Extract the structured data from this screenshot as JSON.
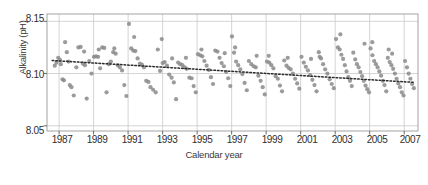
{
  "chart_data": {
    "type": "scatter",
    "title": "",
    "xlabel": "Calendar year",
    "ylabel": "Alkalinity (pH)",
    "xlim": [
      1986.3,
      2007.8
    ],
    "ylim": [
      8.045,
      8.157
    ],
    "xticks": [
      "1987",
      "1989",
      "1991",
      "1993",
      "1995",
      "1997",
      "1999",
      "2001",
      "2003",
      "2005",
      "2007"
    ],
    "xtick_values": [
      1987,
      1989,
      1991,
      1993,
      1995,
      1997,
      1999,
      2001,
      2003,
      2005,
      2007
    ],
    "yticks": [
      "8.05",
      "8.10",
      "8.15"
    ],
    "ytick_values": [
      8.05,
      8.1,
      8.15
    ],
    "grid": true,
    "grid_color": "#c9c9c9",
    "legend": "none",
    "marker_color": "#8a8a8a",
    "marker_shape": "circle",
    "marker_size": 2.1,
    "trend": {
      "name": "fitted trend",
      "style": "dotted",
      "color": "#2b2b2b",
      "x_start": 1986.6,
      "x_end": 2007.6,
      "y_start": 8.1125,
      "y_end": 8.0915
    },
    "series": [
      {
        "name": "Alkalinity (pH)",
        "points": [
          [
            1986.75,
            8.1075
          ],
          [
            1986.85,
            8.1105
          ],
          [
            1986.95,
            8.115
          ],
          [
            1987.05,
            8.113
          ],
          [
            1987.1,
            8.109
          ],
          [
            1987.2,
            8.0945
          ],
          [
            1987.28,
            8.0935
          ],
          [
            1987.35,
            8.13
          ],
          [
            1987.45,
            8.1205
          ],
          [
            1987.55,
            8.1115
          ],
          [
            1987.62,
            8.089
          ],
          [
            1987.72,
            8.087
          ],
          [
            1987.85,
            8.079
          ],
          [
            1988.0,
            8.106
          ],
          [
            1988.12,
            8.125
          ],
          [
            1988.25,
            8.1255
          ],
          [
            1988.38,
            8.1095
          ],
          [
            1988.5,
            8.108
          ],
          [
            1988.6,
            8.076
          ],
          [
            1988.75,
            8.112
          ],
          [
            1988.88,
            8.1
          ],
          [
            1989.02,
            8.116
          ],
          [
            1989.14,
            8.1165
          ],
          [
            1989.26,
            8.116
          ],
          [
            1989.38,
            8.105
          ],
          [
            1989.5,
            8.125
          ],
          [
            1989.62,
            8.1245
          ],
          [
            1989.75,
            8.082
          ],
          [
            1989.88,
            8.109
          ],
          [
            1990.0,
            8.1115
          ],
          [
            1990.14,
            8.1205
          ],
          [
            1990.28,
            8.119
          ],
          [
            1990.4,
            8.108
          ],
          [
            1990.52,
            8.106
          ],
          [
            1990.65,
            8.103
          ],
          [
            1990.78,
            8.089
          ],
          [
            1990.9,
            8.0785
          ],
          [
            1991.05,
            8.1475
          ],
          [
            1991.18,
            8.124
          ],
          [
            1991.3,
            8.122
          ],
          [
            1991.42,
            8.1215
          ],
          [
            1991.55,
            8.1145
          ],
          [
            1991.68,
            8.1095
          ],
          [
            1991.8,
            8.1085
          ],
          [
            1991.92,
            8.106
          ],
          [
            1992.05,
            8.093
          ],
          [
            1992.18,
            8.092
          ],
          [
            1992.3,
            8.087
          ],
          [
            1992.45,
            8.0845
          ],
          [
            1992.6,
            8.082
          ],
          [
            1992.72,
            8.123
          ],
          [
            1992.85,
            8.1025
          ],
          [
            1993.0,
            8.11
          ],
          [
            1993.12,
            8.111
          ],
          [
            1993.25,
            8.1075
          ],
          [
            1993.38,
            8.099
          ],
          [
            1993.52,
            8.096
          ],
          [
            1993.65,
            8.0915
          ],
          [
            1993.78,
            8.0755
          ],
          [
            1993.9,
            8.1105
          ],
          [
            1994.02,
            8.109
          ],
          [
            1994.15,
            8.108
          ],
          [
            1994.28,
            8.106
          ],
          [
            1994.4,
            8.1045
          ],
          [
            1994.55,
            8.096
          ],
          [
            1994.68,
            8.0955
          ],
          [
            1994.8,
            8.088
          ],
          [
            1994.92,
            8.082
          ],
          [
            1995.05,
            8.1185
          ],
          [
            1995.18,
            8.1175
          ],
          [
            1995.3,
            8.1165
          ],
          [
            1995.42,
            8.112
          ],
          [
            1995.55,
            8.1075
          ],
          [
            1995.68,
            8.1035
          ],
          [
            1995.8,
            8.0965
          ],
          [
            1995.92,
            8.09
          ],
          [
            1996.05,
            8.122
          ],
          [
            1996.18,
            8.121
          ],
          [
            1996.3,
            8.115
          ],
          [
            1996.42,
            8.11
          ],
          [
            1996.55,
            8.107
          ],
          [
            1996.68,
            8.1015
          ],
          [
            1996.8,
            8.0955
          ],
          [
            1996.92,
            8.088
          ],
          [
            1997.02,
            8.1355
          ],
          [
            1997.14,
            8.12
          ],
          [
            1997.26,
            8.1115
          ],
          [
            1997.38,
            8.108
          ],
          [
            1997.5,
            8.104
          ],
          [
            1997.62,
            8.0995
          ],
          [
            1997.75,
            8.091
          ],
          [
            1997.88,
            8.084
          ],
          [
            1998.0,
            8.112
          ],
          [
            1998.14,
            8.109
          ],
          [
            1998.28,
            8.107
          ],
          [
            1998.4,
            8.106
          ],
          [
            1998.55,
            8.098
          ],
          [
            1998.68,
            8.093
          ],
          [
            1998.8,
            8.087
          ],
          [
            1998.92,
            8.08
          ],
          [
            1999.05,
            8.1115
          ],
          [
            1999.18,
            8.1105
          ],
          [
            1999.3,
            8.108
          ],
          [
            1999.42,
            8.105
          ],
          [
            1999.55,
            8.0975
          ],
          [
            1999.68,
            8.095
          ],
          [
            1999.8,
            8.0885
          ],
          [
            1999.92,
            8.083
          ],
          [
            2000.05,
            8.1125
          ],
          [
            2000.18,
            8.1075
          ],
          [
            2000.3,
            8.1055
          ],
          [
            2000.42,
            8.104
          ],
          [
            2000.55,
            8.1
          ],
          [
            2000.68,
            8.095
          ],
          [
            2000.8,
            8.0905
          ],
          [
            2000.92,
            8.0855
          ],
          [
            2001.05,
            8.116
          ],
          [
            2001.18,
            8.1105
          ],
          [
            2001.3,
            8.1065
          ],
          [
            2001.42,
            8.103
          ],
          [
            2001.55,
            8.0985
          ],
          [
            2001.68,
            8.094
          ],
          [
            2001.8,
            8.089
          ],
          [
            2001.92,
            8.083
          ],
          [
            2002.05,
            8.1205
          ],
          [
            2002.18,
            8.1145
          ],
          [
            2002.3,
            8.109
          ],
          [
            2002.42,
            8.104
          ],
          [
            2002.55,
            8.1
          ],
          [
            2002.68,
            8.0945
          ],
          [
            2002.8,
            8.09
          ],
          [
            2002.92,
            8.086
          ],
          [
            2003.05,
            8.133
          ],
          [
            2003.16,
            8.125
          ],
          [
            2003.26,
            8.123
          ],
          [
            2003.36,
            8.118
          ],
          [
            2003.46,
            8.114
          ],
          [
            2003.56,
            8.108
          ],
          [
            2003.66,
            8.102
          ],
          [
            2003.76,
            8.0965
          ],
          [
            2003.86,
            8.093
          ],
          [
            2003.96,
            8.088
          ],
          [
            2004.05,
            8.12
          ],
          [
            2004.16,
            8.1135
          ],
          [
            2004.26,
            8.109
          ],
          [
            2004.36,
            8.106
          ],
          [
            2004.46,
            8.1015
          ],
          [
            2004.56,
            8.0975
          ],
          [
            2004.66,
            8.093
          ],
          [
            2004.76,
            8.0885
          ],
          [
            2004.86,
            8.085
          ],
          [
            2004.96,
            8.082
          ],
          [
            2005.05,
            8.124
          ],
          [
            2005.16,
            8.1175
          ],
          [
            2005.26,
            8.112
          ],
          [
            2005.36,
            8.109
          ],
          [
            2005.46,
            8.106
          ],
          [
            2005.56,
            8.102
          ],
          [
            2005.66,
            8.098
          ],
          [
            2005.76,
            8.093
          ],
          [
            2005.86,
            8.089
          ],
          [
            2005.96,
            8.083
          ],
          [
            2006.05,
            8.115
          ],
          [
            2006.16,
            8.111
          ],
          [
            2006.26,
            8.108
          ],
          [
            2006.36,
            8.1045
          ],
          [
            2006.46,
            8.1
          ],
          [
            2006.56,
            8.095
          ],
          [
            2006.66,
            8.0905
          ],
          [
            2006.76,
            8.087
          ],
          [
            2006.86,
            8.082
          ],
          [
            2006.96,
            8.079
          ],
          [
            2007.05,
            8.112
          ],
          [
            2007.16,
            8.106
          ],
          [
            2007.26,
            8.1
          ],
          [
            2007.36,
            8.095
          ],
          [
            2007.46,
            8.09
          ],
          [
            2007.56,
            8.086
          ],
          [
            1991.35,
            8.135
          ],
          [
            1992.95,
            8.133
          ],
          [
            1998.45,
            8.117
          ],
          [
            2003.3,
            8.1375
          ],
          [
            2004.7,
            8.1285
          ],
          [
            2005.15,
            8.13
          ],
          [
            1990.2,
            8.124
          ],
          [
            1989.3,
            8.123
          ],
          [
            2006.1,
            8.123
          ],
          [
            2006.3,
            8.119
          ],
          [
            1995.25,
            8.123
          ],
          [
            1996.6,
            8.1195
          ],
          [
            1997.2,
            8.125
          ],
          [
            1999.15,
            8.117
          ],
          [
            2000.25,
            8.115
          ],
          [
            2001.6,
            8.114
          ],
          [
            2002.1,
            8.116
          ],
          [
            1988.45,
            8.121
          ],
          [
            1994.35,
            8.115
          ],
          [
            1993.55,
            8.1145
          ]
        ]
      }
    ]
  },
  "axes": {
    "ylabel_text": "Alkalinity (pH)",
    "xlabel_text": "Calendar year"
  }
}
